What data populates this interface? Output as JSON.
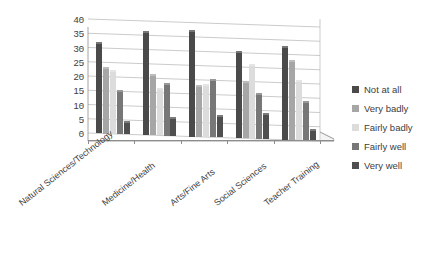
{
  "chart_data": {
    "type": "bar",
    "title": "",
    "subtitle": "",
    "xlabel": "",
    "ylabel": "",
    "ylim": [
      0,
      40
    ],
    "ytick_step": 5,
    "yticks": [
      40,
      35,
      30,
      25,
      20,
      15,
      10,
      5,
      0
    ],
    "grid": true,
    "grid_axis": "y",
    "legend_position": "right",
    "orientation": "vertical",
    "grouping": "clustered",
    "style": "3d-column",
    "categories": [
      "Natural Sciences/Technology",
      "Medicine/Health",
      "Arts/Fine Arts",
      "Social Sciences",
      "Teacher Training"
    ],
    "series": [
      {
        "name": "Not at all",
        "color": "#4a4a4a",
        "values": [
          32,
          36.5,
          37.5,
          30.5,
          33
        ]
      },
      {
        "name": "Very badly",
        "color": "#a6a6a6",
        "values": [
          23.5,
          21.5,
          18,
          20,
          28
        ]
      },
      {
        "name": "Fairly badly",
        "color": "#dcdcdc",
        "values": [
          22.5,
          16.5,
          18.5,
          26,
          21
        ]
      },
      {
        "name": "Fairly well",
        "color": "#777777",
        "values": [
          15.5,
          18.5,
          20.5,
          16,
          14
        ]
      },
      {
        "name": "Very well",
        "color": "#4f4f4f",
        "values": [
          4.5,
          6.5,
          8,
          9,
          4
        ]
      }
    ]
  },
  "legend": {
    "items": [
      {
        "label": "Not at all",
        "color": "#4a4a4a"
      },
      {
        "label": "Very badly",
        "color": "#a6a6a6"
      },
      {
        "label": "Fairly badly",
        "color": "#dcdcdc"
      },
      {
        "label": "Fairly well",
        "color": "#777777"
      },
      {
        "label": "Very well",
        "color": "#4f4f4f"
      }
    ]
  },
  "axes": {
    "y": {
      "ticks": [
        "40",
        "35",
        "30",
        "25",
        "20",
        "15",
        "10",
        "5",
        "0"
      ]
    },
    "x": {
      "ticks": [
        "Natural Sciences/Technology",
        "Medicine/Health",
        "Arts/Fine Arts",
        "Social Sciences",
        "Teacher Training"
      ]
    }
  },
  "colors": {
    "background": "#ffffff",
    "gridline": "#b5b5b5",
    "axis": "#8d8d8d",
    "text": "#3d3d3d"
  }
}
